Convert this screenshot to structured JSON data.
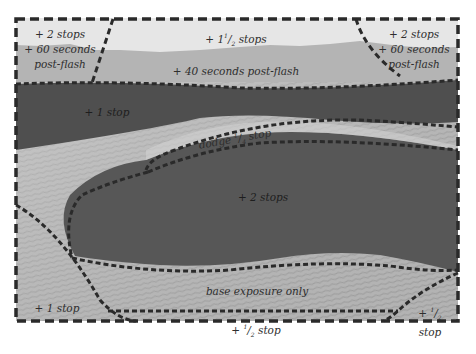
{
  "figure": {
    "type": "darkroom print map",
    "colors": {
      "page": "#ffffff",
      "sky": "#e6e6e6",
      "mountain": "#b4b4b4",
      "burn_band": "#4f4f4f",
      "dune_shadow": "#575757",
      "sand_light": "#c8c8c8",
      "sand_mid": "#a9a9a9",
      "dash_line": "#2a2a2a"
    }
  },
  "regions": {
    "top_left": {
      "lines": [
        "+ 2 stops",
        "+ 60 seconds",
        "post-flash"
      ]
    },
    "top_center": {
      "line1": "+ 1",
      "sup": "1",
      "sep": "/",
      "sub": "2",
      "line1_end": " stops",
      "line2": "+ 40 seconds post-flash"
    },
    "top_right": {
      "lines": [
        "+ 2 stops",
        "+ 60 seconds",
        "post-flash"
      ]
    },
    "band": {
      "label": "+ 1 stop"
    },
    "ridge": {
      "prefix": "dodge ",
      "sup": "1",
      "sep": "/",
      "sub": "4",
      "suffix": " stop"
    },
    "dune": {
      "label": "+ 2 stops"
    },
    "base": {
      "label": "base exposure only"
    },
    "bottom_left": {
      "label": "+ 1 stop"
    },
    "bottom_center": {
      "prefix": "+ ",
      "sup": "1",
      "sep": "/",
      "sub": "2",
      "suffix": " stop"
    },
    "bottom_right": {
      "prefix": "+ ",
      "sup": "1",
      "sep": "/",
      "sub": "2",
      "line2": "stop"
    }
  }
}
